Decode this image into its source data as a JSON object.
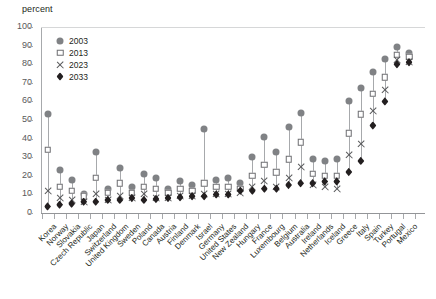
{
  "axis_unit_label": "percent",
  "legend": {
    "position": "top-left-inside",
    "entries": [
      {
        "label": "2003",
        "marker": "circle",
        "color": "#808285"
      },
      {
        "label": "2013",
        "marker": "square",
        "color": "#ffffff"
      },
      {
        "label": "2023",
        "marker": "cross",
        "color": "#58595b"
      },
      {
        "label": "2033",
        "marker": "diamond",
        "color": "#231f20"
      }
    ]
  },
  "chart_data": {
    "type": "scatter",
    "title": "",
    "subtitle": "",
    "xlabel": "",
    "ylabel": "percent",
    "ylim": [
      0,
      100
    ],
    "ytick_values": [
      0,
      10,
      20,
      30,
      40,
      50,
      60,
      70,
      80,
      90,
      100
    ],
    "grid": false,
    "legend_position": "top-left-inside",
    "categories": [
      "Korea",
      "Norway",
      "Slovakia",
      "Czech Republic",
      "Japan",
      "Switzerland",
      "United Kingdom",
      "Sweden",
      "Poland",
      "Canada",
      "Austria",
      "Finland",
      "Denmark",
      "Israel",
      "Germany",
      "United States",
      "New Zealand",
      "Hungary",
      "France",
      "Luxembourg",
      "Belgium",
      "Australia",
      "Ireland",
      "Netherlands",
      "Iceland",
      "Greece",
      "Italy",
      "Spain",
      "Turkey",
      "Portugal",
      "Mexico"
    ],
    "series": [
      {
        "name": "2003",
        "marker": "circle",
        "values": [
          53,
          23,
          18,
          10,
          33,
          13,
          24,
          14,
          21,
          19,
          13,
          17,
          15,
          45,
          18,
          19,
          16,
          30,
          41,
          33,
          46,
          54,
          29,
          28,
          29,
          60,
          67,
          76,
          83,
          89,
          86
        ]
      },
      {
        "name": "2013",
        "marker": "square",
        "values": [
          34,
          14,
          12,
          9,
          19,
          11,
          16,
          11,
          14,
          13,
          11,
          13,
          12,
          16,
          14,
          14,
          13,
          20,
          26,
          22,
          29,
          38,
          21,
          20,
          20,
          43,
          53,
          64,
          73,
          85,
          84
        ]
      },
      {
        "name": "2023",
        "marker": "cross",
        "values": [
          12,
          8,
          7,
          6,
          10,
          7,
          9,
          8,
          10,
          8,
          8,
          9,
          9,
          10,
          10,
          10,
          11,
          14,
          17,
          14,
          19,
          25,
          15,
          14,
          13,
          31,
          37,
          55,
          66,
          82,
          81
        ]
      },
      {
        "name": "2033",
        "marker": "diamond",
        "values": [
          3.5,
          4.5,
          5,
          6,
          6,
          7,
          7,
          8,
          7,
          7.5,
          8,
          8.5,
          9,
          9,
          10,
          10,
          12,
          12,
          13,
          13,
          15,
          16,
          16,
          17,
          17,
          22,
          28,
          47,
          60,
          80,
          81
        ]
      }
    ]
  }
}
